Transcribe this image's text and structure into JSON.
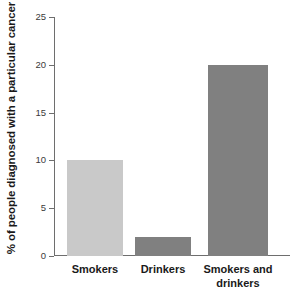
{
  "chart_data": {
    "type": "bar",
    "title": "",
    "xlabel": "",
    "ylabel": "% of people diagnosed with a particular cancer",
    "ylim": [
      0,
      25
    ],
    "yticks": [
      0,
      5,
      10,
      15,
      20,
      25
    ],
    "ytick_labels": [
      "0",
      "5",
      "10",
      "15",
      "20",
      "25"
    ],
    "grid": false,
    "legend": "none",
    "categories": [
      "Smokers",
      "Drinkers",
      "Smokers and drinkers"
    ],
    "category_lines": [
      [
        "Smokers"
      ],
      [
        "Drinkers"
      ],
      [
        "Smokers and",
        "drinkers"
      ]
    ],
    "values": [
      10,
      2,
      20
    ],
    "bar_colors": [
      "#c9c9c9",
      "#808080",
      "#808080"
    ],
    "axis_color": "#6e6e6e",
    "text_color": "#1a1a1a",
    "background": "#ffffff"
  }
}
